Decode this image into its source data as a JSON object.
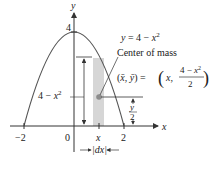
{
  "diagram": {
    "axes": {
      "x_label": "x",
      "y_label": "y",
      "x_ticks": [
        "−2",
        "0",
        "x",
        "2"
      ],
      "y_tick": "4"
    },
    "curve": {
      "equation_lhs": "y = 4 − x",
      "equation_exp": "2"
    },
    "strip": {
      "height_label": "4 − x",
      "height_exp": "2",
      "width_label": "|dx|",
      "fill_color": "#d3d3d3"
    },
    "center_of_mass": {
      "title": "Center of mass",
      "coords_label": "(x̄, ȳ) =",
      "value_open": "x,",
      "frac_num": "4 − x",
      "frac_num_exp": "2",
      "frac_den": "2",
      "dot_color": "#8c8c8c"
    },
    "half_height": {
      "num": "y",
      "den": "2"
    }
  }
}
